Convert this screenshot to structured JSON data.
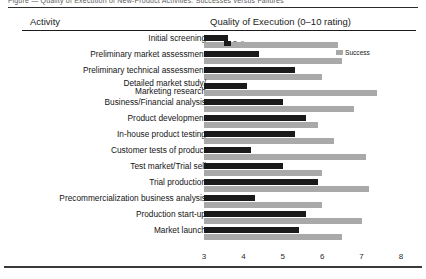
{
  "caption": "Figure — Quality of Execution of New-Product Activities: Successes versus Failures",
  "table_headers": {
    "activity": "Activity",
    "quality": "Quality of Execution (0–10 rating)"
  },
  "legend": {
    "failure_label": "Failure",
    "success_label": "Success",
    "failure_color": "#1a1a1a",
    "success_color": "#a9a9a9"
  },
  "axis": {
    "ticks": [
      "3",
      "4",
      "5",
      "6",
      "7",
      "8"
    ],
    "min": 3,
    "max": 8
  },
  "chart_data": {
    "type": "bar",
    "title": "Quality of Execution (0–10 rating)",
    "xlabel": "",
    "ylabel": "Activity",
    "xlim": [
      3,
      8
    ],
    "grid": false,
    "orientation": "horizontal",
    "legend_position": "inside-top",
    "categories": [
      "Initial screening",
      "Preliminary market assessment",
      "Preliminary technical assessment",
      "Detailed market study/\nMarketing research",
      "Business/Financial analysis",
      "Product development",
      "In-house product testing",
      "Customer tests of product",
      "Test market/Trial sell",
      "Trial production",
      "Precommercialization business analysis",
      "Production start-up",
      "Market launch"
    ],
    "series": [
      {
        "name": "Failure",
        "color": "#1a1a1a",
        "values": [
          3.6,
          4.4,
          5.3,
          4.1,
          5.0,
          5.6,
          5.3,
          4.2,
          5.0,
          5.9,
          4.3,
          5.6,
          5.4
        ]
      },
      {
        "name": "Success",
        "color": "#a9a9a9",
        "values": [
          6.4,
          6.5,
          6.0,
          7.4,
          6.8,
          5.9,
          6.3,
          7.1,
          6.0,
          7.2,
          6.0,
          7.0,
          6.5
        ]
      }
    ],
    "annotations": [
      {
        "text": "Failure",
        "attached_to": "Initial screening",
        "series": "Failure"
      },
      {
        "text": "Success",
        "attached_to": "Initial screening",
        "series": "Success"
      }
    ]
  },
  "rows": [
    {
      "label": "Initial screening",
      "two_line": false,
      "failure": 3.6,
      "success": 6.4
    },
    {
      "label": "Preliminary market assessment",
      "two_line": false,
      "failure": 4.4,
      "success": 6.5
    },
    {
      "label": "Preliminary technical assessment",
      "two_line": false,
      "failure": 5.3,
      "success": 6.0
    },
    {
      "label": "Detailed market study/",
      "label2": "Marketing research",
      "two_line": true,
      "failure": 4.1,
      "success": 7.4
    },
    {
      "label": "Business/Financial analysis",
      "two_line": false,
      "failure": 5.0,
      "success": 6.8
    },
    {
      "label": "Product development",
      "two_line": false,
      "failure": 5.6,
      "success": 5.9
    },
    {
      "label": "In-house product testing",
      "two_line": false,
      "failure": 5.3,
      "success": 6.3
    },
    {
      "label": "Customer tests of product",
      "two_line": false,
      "failure": 4.2,
      "success": 7.1
    },
    {
      "label": "Test market/Trial sell",
      "two_line": false,
      "failure": 5.0,
      "success": 6.0
    },
    {
      "label": "Trial production",
      "two_line": false,
      "failure": 5.9,
      "success": 7.2
    },
    {
      "label": "Precommercialization business analysis",
      "two_line": false,
      "failure": 4.3,
      "success": 6.0
    },
    {
      "label": "Production start-up",
      "two_line": false,
      "failure": 5.6,
      "success": 7.0
    },
    {
      "label": "Market launch",
      "two_line": false,
      "failure": 5.4,
      "success": 6.5
    }
  ]
}
